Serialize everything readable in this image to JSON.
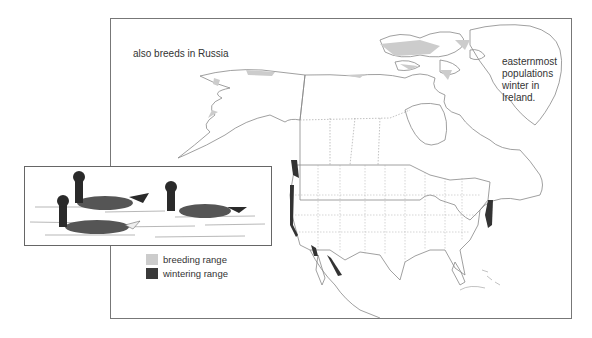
{
  "annotations": {
    "russia": "also breeds in Russia",
    "ireland": "easternmost populations winter in Ireland."
  },
  "legend": {
    "items": [
      {
        "label": "breeding range",
        "color": "#cccccc"
      },
      {
        "label": "wintering range",
        "color": "#3a3a3a"
      }
    ]
  },
  "inset": {
    "subject": "three brant geese swimming on water"
  },
  "map": {
    "region": "North America",
    "colors": {
      "outline": "#777777",
      "breeding": "#cccccc",
      "wintering": "#333333"
    }
  }
}
